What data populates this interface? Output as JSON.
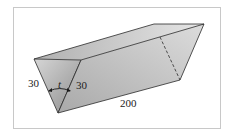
{
  "figure": {
    "labels": {
      "left_side": "30",
      "right_side": "30",
      "length": "200",
      "angle": "t"
    },
    "colors": {
      "edge": "#2a2a2a",
      "frame": "#c8c8c8",
      "front_face": "#b8b8b8",
      "long_face": "#c4c4c4",
      "top_back_face": "#d8d8d8"
    }
  }
}
